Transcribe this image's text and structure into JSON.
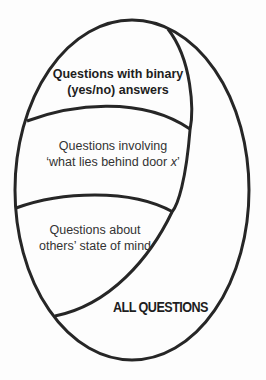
{
  "diagram": {
    "type": "nested-set-diagram",
    "outer_set": {
      "label": "ALL QUESTIONS"
    },
    "inner_set": {
      "regions": [
        {
          "line1": "Questions with binary",
          "line2": "(yes/no) answers",
          "style": "bold"
        },
        {
          "line1": "Questions involving",
          "line2_prefix": "‘what lies behind door ",
          "line2_var": "x",
          "line2_suffix": "’",
          "style": "regular"
        },
        {
          "line1": "Questions about",
          "line2": "others’ state of mind",
          "style": "regular"
        }
      ]
    },
    "colors": {
      "stroke": "#262626",
      "background": "#fdfdfd",
      "text": "#2b2b2b"
    }
  }
}
